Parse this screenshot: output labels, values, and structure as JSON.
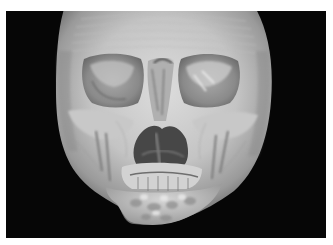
{
  "image": {
    "subject": "3D volume-rendered CT reconstruction of a skull, frontal view",
    "alt": "3D CT reconstruction of skull (frontal view) showing facial bones, orbits, nasal cavity, maxilla and mandible",
    "colors": {
      "background": "#060606",
      "border": "#ffffff",
      "bone_light": "#d8d8d8",
      "bone_mid": "#a9a9a9",
      "bone_shadow": "#5e5e5e",
      "cavity": "#3a3a3a"
    },
    "regions": [
      "cranial-vault",
      "left-orbit",
      "right-orbit",
      "nasal-aperture",
      "maxilla",
      "teeth",
      "mandible",
      "zygomatic-arches"
    ]
  }
}
